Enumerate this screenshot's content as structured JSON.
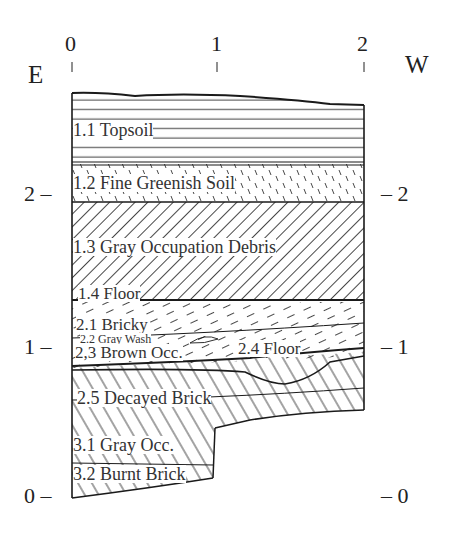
{
  "diagram": {
    "type": "stratigraphic-section",
    "orientation": {
      "left": "E",
      "right": "W"
    },
    "horizontal_axis": {
      "ticks": [
        "0",
        "1",
        "2"
      ]
    },
    "vertical_axis": {
      "left_ticks": [
        "2 –",
        "1 –",
        "0 –"
      ],
      "right_ticks": [
        "– 2",
        "– 1",
        "– 0"
      ]
    },
    "layers": [
      {
        "id": "1.1",
        "label": "1.1 Topsoil",
        "pattern": "horizontal-lines"
      },
      {
        "id": "1.2",
        "label": "1.2 Fine Greenish Soil",
        "pattern": "short-back-ticks"
      },
      {
        "id": "1.3",
        "label": "1.3 Gray Occupation Debris",
        "pattern": "diagonal-hatch"
      },
      {
        "id": "1.4",
        "label": "1.4 Floor",
        "pattern": "line"
      },
      {
        "id": "2.1",
        "label": "2.1 Bricky",
        "pattern": "dashed-diagonal"
      },
      {
        "id": "2.2",
        "label": "2.2 Gray Wash",
        "pattern": "lens"
      },
      {
        "id": "2.3",
        "label": "2,3 Brown Occ.",
        "pattern": "dashed-diagonal"
      },
      {
        "id": "2.4",
        "label": "2.4 Floor",
        "pattern": "line"
      },
      {
        "id": "2.5",
        "label": "2.5 Decayed Brick",
        "pattern": "back-diagonal-hatch"
      },
      {
        "id": "3.1",
        "label": "3.1 Gray Occ.",
        "pattern": "back-diagonal-hatch"
      },
      {
        "id": "3.2",
        "label": "3.2 Burnt Brick",
        "pattern": "back-diagonal-hatch"
      }
    ],
    "colors": {
      "ink": "#1a1a1a",
      "text": "#333333",
      "background": "#ffffff"
    }
  }
}
